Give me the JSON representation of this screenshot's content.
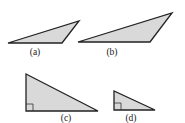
{
  "figure": {
    "triangles": [
      {
        "id": "a",
        "label": "(a)",
        "points": "8,43 79,21 62,43",
        "label_pos": {
          "x": 35,
          "y": 55
        },
        "right_angle": false
      },
      {
        "id": "b",
        "label": "(b)",
        "points": "78,42 172,13 150,42",
        "label_pos": {
          "x": 112,
          "y": 55
        },
        "right_angle": false
      },
      {
        "id": "c",
        "label": "(c)",
        "points": "26,74 26,111 98,111",
        "label_pos": {
          "x": 66,
          "y": 121
        },
        "right_angle": true,
        "right_angle_mark": "26,104 33,104 33,111"
      },
      {
        "id": "d",
        "label": "(d)",
        "points": "114,91 114,110 155,110",
        "label_pos": {
          "x": 131,
          "y": 121
        },
        "right_angle": true,
        "right_angle_mark": "114,103 121,103 121,110"
      }
    ],
    "colors": {
      "fill": "#d9d9d9",
      "stroke": "#222222",
      "background": "#ffffff"
    }
  }
}
